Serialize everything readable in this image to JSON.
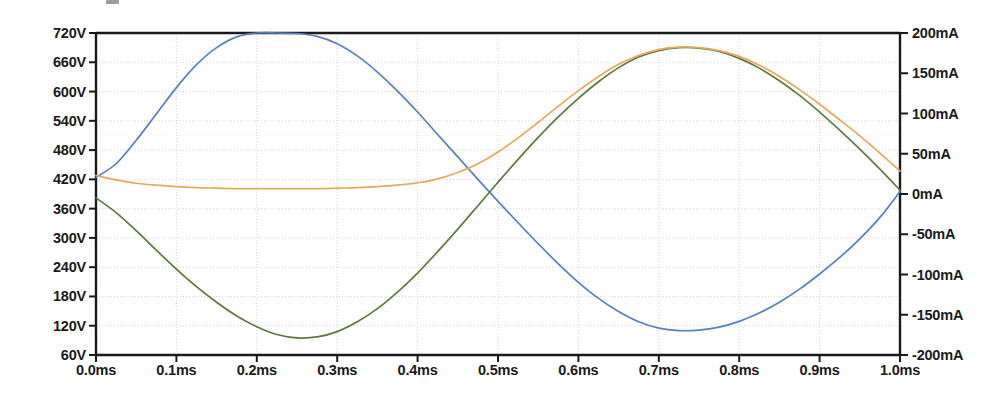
{
  "chart_data": {
    "type": "line",
    "title": "",
    "xlabel": "",
    "ylabel": "",
    "grid": true,
    "legend": "none",
    "x_axis": {
      "unit": "ms",
      "min": 0.0,
      "max": 1.0,
      "tick_labels": [
        "0.0ms",
        "0.1ms",
        "0.2ms",
        "0.3ms",
        "0.4ms",
        "0.5ms",
        "0.6ms",
        "0.7ms",
        "0.8ms",
        "0.9ms",
        "1.0ms"
      ],
      "tick_values": [
        0.0,
        0.1,
        0.2,
        0.3,
        0.4,
        0.5,
        0.6,
        0.7,
        0.8,
        0.9,
        1.0
      ]
    },
    "y_axis_left": {
      "unit": "V",
      "min": 60,
      "max": 720,
      "step": 60,
      "tick_labels": [
        "720V",
        "660V",
        "600V",
        "540V",
        "480V",
        "420V",
        "360V",
        "300V",
        "240V",
        "180V",
        "120V",
        "60V"
      ],
      "tick_values": [
        720,
        660,
        600,
        540,
        480,
        420,
        360,
        300,
        240,
        180,
        120,
        60
      ]
    },
    "y_axis_right": {
      "unit": "mA",
      "min": -200,
      "max": 200,
      "step": 50,
      "tick_labels": [
        "200mA",
        "150mA",
        "100mA",
        "50mA",
        "0mA",
        "-50mA",
        "-100mA",
        "-150mA",
        "-200mA"
      ],
      "tick_values": [
        200,
        150,
        100,
        50,
        0,
        -50,
        -100,
        -150,
        -200
      ]
    },
    "series": [
      {
        "name": "blue-trace",
        "color": "#5a7fc0",
        "axis": "left",
        "x": [
          0.0,
          0.025,
          0.05,
          0.075,
          0.1,
          0.125,
          0.15,
          0.175,
          0.2,
          0.225,
          0.25,
          0.275,
          0.3,
          0.325,
          0.35,
          0.375,
          0.4,
          0.425,
          0.45,
          0.475,
          0.5,
          0.525,
          0.55,
          0.575,
          0.6,
          0.625,
          0.65,
          0.675,
          0.7,
          0.725,
          0.75,
          0.775,
          0.8,
          0.825,
          0.85,
          0.875,
          0.9,
          0.925,
          0.95,
          0.975,
          1.0
        ],
        "y": [
          424,
          452,
          500,
          554,
          608,
          655,
          690,
          712,
          720,
          720,
          719,
          713,
          698,
          673,
          640,
          601,
          558,
          512,
          466,
          420,
          375,
          331,
          288,
          247,
          209,
          176,
          149,
          128,
          115,
          110,
          111,
          117,
          129,
          146,
          168,
          195,
          226,
          260,
          298,
          342,
          395
        ]
      },
      {
        "name": "green-trace",
        "color": "#5c7a3e",
        "axis": "left",
        "x": [
          0.0,
          0.025,
          0.05,
          0.075,
          0.1,
          0.125,
          0.15,
          0.175,
          0.2,
          0.225,
          0.25,
          0.275,
          0.3,
          0.325,
          0.35,
          0.375,
          0.4,
          0.425,
          0.45,
          0.475,
          0.5,
          0.525,
          0.55,
          0.575,
          0.6,
          0.625,
          0.65,
          0.675,
          0.7,
          0.725,
          0.75,
          0.775,
          0.8,
          0.825,
          0.85,
          0.875,
          0.9,
          0.925,
          0.95,
          0.975,
          1.0
        ],
        "y": [
          382,
          352,
          315,
          275,
          236,
          200,
          168,
          140,
          118,
          102,
          95,
          97,
          108,
          128,
          155,
          189,
          228,
          272,
          318,
          366,
          414,
          461,
          506,
          548,
          586,
          620,
          649,
          671,
          684,
          690,
          689,
          682,
          668,
          648,
          622,
          592,
          558,
          521,
          482,
          441,
          398
        ]
      },
      {
        "name": "orange-trace",
        "color": "#e8a85c",
        "axis": "left",
        "x": [
          0.0,
          0.025,
          0.05,
          0.075,
          0.1,
          0.125,
          0.15,
          0.175,
          0.2,
          0.225,
          0.25,
          0.275,
          0.3,
          0.325,
          0.35,
          0.375,
          0.4,
          0.425,
          0.45,
          0.475,
          0.5,
          0.525,
          0.55,
          0.575,
          0.6,
          0.625,
          0.65,
          0.675,
          0.7,
          0.725,
          0.75,
          0.775,
          0.8,
          0.825,
          0.85,
          0.875,
          0.9,
          0.925,
          0.95,
          0.975,
          1.0
        ],
        "y": [
          428,
          419,
          412,
          408,
          405,
          403,
          402,
          401,
          401,
          401,
          401,
          401,
          402,
          403,
          405,
          408,
          413,
          421,
          434,
          452,
          476,
          505,
          537,
          570,
          602,
          631,
          656,
          674,
          686,
          691,
          690,
          684,
          672,
          654,
          631,
          604,
          574,
          542,
          509,
          474,
          437
        ]
      }
    ],
    "annotations": {
      "blue_peak": {
        "x": 0.23,
        "y": 720
      },
      "blue_min": {
        "x": 0.73,
        "y": 110
      },
      "green_min": {
        "x": 0.25,
        "y": 95
      },
      "green_peak": {
        "x": 0.74,
        "y": 690
      }
    }
  },
  "plot_geometry": {
    "left_px": 96,
    "right_px": 900,
    "top_px": 33,
    "bottom_px": 355
  },
  "colors": {
    "axis": "#1a1a1a",
    "grid": "#bfbfbf",
    "background": "#ffffff",
    "blue": "#5a7fc0",
    "green": "#5c7a3e",
    "orange": "#e8a85c"
  }
}
